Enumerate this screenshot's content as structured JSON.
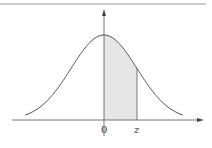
{
  "chart_data": {
    "type": "area",
    "title": "",
    "xlabel": "",
    "ylabel": "",
    "tick_labels": [
      "0",
      "z"
    ],
    "shaded_region": {
      "from": "0",
      "to": "z"
    },
    "series": [
      {
        "name": "standard normal density",
        "mean": 0,
        "sd": 1
      }
    ],
    "grid": false,
    "legend": false,
    "colors": {
      "curve": "#555555",
      "shade": "#e6e6e6",
      "axis": "#444444",
      "border": "#999999"
    }
  },
  "labels": {
    "origin": "0",
    "z": "z"
  }
}
